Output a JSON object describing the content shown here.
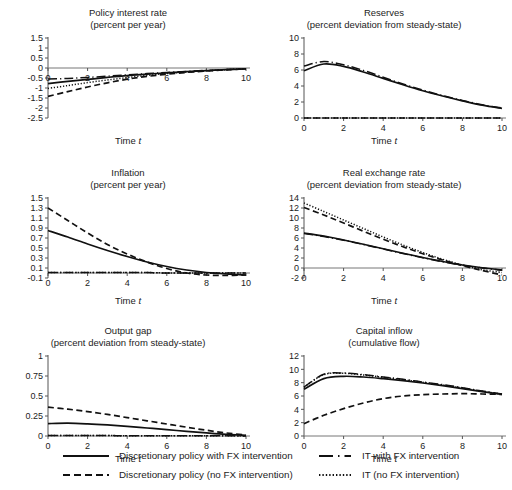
{
  "figure": {
    "xlabel": "Time (t)",
    "xlabel_symbol": "t",
    "legend": [
      {
        "label": "Discretionary policy with FX intervention",
        "style": "solid"
      },
      {
        "label": "Discretionary policy (no FX intervention)",
        "style": "dashed"
      },
      {
        "label": "IT with FX intervention",
        "style": "dash-dot"
      },
      {
        "label": "IT (no FX intervention)",
        "style": "dotted"
      }
    ]
  },
  "chart_data": [
    {
      "type": "line",
      "title": "Policy interest rate",
      "subtitle": "(percent per year)",
      "xlabel": "Time (t)",
      "ylabel": "",
      "xlim": [
        0,
        10
      ],
      "ylim": [
        -2.5,
        1.5
      ],
      "xticks": [
        0,
        2,
        4,
        6,
        8,
        10
      ],
      "yticks": [
        1.5,
        1,
        0.5,
        0,
        -0.5,
        -1,
        -1.5,
        -2,
        -2.5
      ],
      "ytick_labels": [
        "1.5",
        "1",
        "0.5",
        "0",
        "-0.5",
        "-1",
        "-1.5",
        "-2",
        "-2.5"
      ],
      "grid": false,
      "x": [
        0,
        1,
        2,
        3,
        4,
        5,
        6,
        7,
        8,
        9,
        10
      ],
      "series": [
        {
          "name": "Discretionary policy with FX intervention",
          "style": "solid",
          "values": [
            -0.78,
            -0.67,
            -0.57,
            -0.47,
            -0.38,
            -0.31,
            -0.24,
            -0.18,
            -0.13,
            -0.08,
            -0.04
          ]
        },
        {
          "name": "Discretionary policy (no FX intervention)",
          "style": "dashed",
          "values": [
            -1.42,
            -1.18,
            -0.95,
            -0.74,
            -0.56,
            -0.42,
            -0.31,
            -0.22,
            -0.15,
            -0.09,
            -0.04
          ]
        },
        {
          "name": "IT with FX intervention",
          "style": "dash-dot",
          "values": [
            -0.55,
            -0.52,
            -0.47,
            -0.41,
            -0.34,
            -0.28,
            -0.22,
            -0.17,
            -0.12,
            -0.08,
            -0.04
          ]
        },
        {
          "name": "IT (no FX intervention)",
          "style": "dotted",
          "values": [
            -1.02,
            -0.88,
            -0.73,
            -0.6,
            -0.48,
            -0.37,
            -0.28,
            -0.2,
            -0.14,
            -0.08,
            -0.04
          ]
        }
      ]
    },
    {
      "type": "line",
      "title": "Reserves",
      "subtitle": "(percent deviation from steady-state)",
      "xlabel": "Time (t)",
      "ylabel": "",
      "xlim": [
        0,
        10
      ],
      "ylim": [
        0,
        10
      ],
      "xticks": [
        0,
        2,
        4,
        6,
        8,
        10
      ],
      "yticks": [
        0,
        2,
        4,
        6,
        8,
        10
      ],
      "ytick_labels": [
        "0",
        "2",
        "4",
        "6",
        "8",
        "10"
      ],
      "grid": false,
      "x": [
        0,
        1,
        2,
        3,
        4,
        5,
        6,
        7,
        8,
        9,
        10
      ],
      "series": [
        {
          "name": "Discretionary policy with FX intervention",
          "style": "solid",
          "values": [
            5.9,
            6.75,
            6.45,
            5.75,
            4.95,
            4.15,
            3.4,
            2.75,
            2.15,
            1.6,
            1.2
          ]
        },
        {
          "name": "Discretionary policy (no FX intervention)",
          "style": "dashed",
          "values": [
            0,
            0,
            0,
            0,
            0,
            0,
            0,
            0,
            0,
            0,
            0
          ]
        },
        {
          "name": "IT with FX intervention",
          "style": "dash-dot",
          "values": [
            6.5,
            7.05,
            6.65,
            5.95,
            5.1,
            4.25,
            3.5,
            2.8,
            2.2,
            1.65,
            1.25
          ]
        },
        {
          "name": "IT (no FX intervention)",
          "style": "dotted",
          "values": [
            0,
            0,
            0,
            0,
            0,
            0,
            0,
            0,
            0,
            0,
            0
          ]
        }
      ]
    },
    {
      "type": "line",
      "title": "Inflation",
      "subtitle": "(percent per year)",
      "xlabel": "Time (t)",
      "ylabel": "",
      "xlim": [
        0,
        10
      ],
      "ylim": [
        -0.1,
        1.5
      ],
      "xticks": [
        0,
        2,
        4,
        6,
        8,
        10
      ],
      "yticks": [
        1.5,
        1.3,
        1.1,
        0.9,
        0.7,
        0.5,
        0.3,
        0.1,
        -0.1
      ],
      "ytick_labels": [
        "1.5",
        "1.3",
        "1.1",
        "0.9",
        "0.7",
        "0.5",
        "0.3",
        "0.1",
        "-0.1"
      ],
      "grid": false,
      "x": [
        0,
        1,
        2,
        3,
        4,
        5,
        6,
        7,
        8,
        9,
        10
      ],
      "series": [
        {
          "name": "Discretionary policy with FX intervention",
          "style": "solid",
          "values": [
            0.85,
            0.72,
            0.58,
            0.45,
            0.33,
            0.22,
            0.13,
            0.06,
            0.01,
            -0.02,
            -0.04
          ]
        },
        {
          "name": "Discretionary policy (no FX intervention)",
          "style": "dashed",
          "values": [
            1.3,
            1.05,
            0.8,
            0.57,
            0.38,
            0.22,
            0.09,
            0.0,
            -0.04,
            -0.05,
            -0.04
          ]
        },
        {
          "name": "IT with FX intervention",
          "style": "dash-dot",
          "values": [
            0.01,
            0.01,
            0.01,
            0.01,
            0.01,
            0.01,
            0.0,
            0.0,
            0.0,
            0.0,
            0.0
          ]
        },
        {
          "name": "IT (no FX intervention)",
          "style": "dotted",
          "values": [
            0.01,
            0.01,
            0.01,
            0.01,
            0.01,
            0.01,
            0.0,
            0.0,
            0.0,
            0.0,
            0.0
          ]
        }
      ]
    },
    {
      "type": "line",
      "title": "Real exchange rate",
      "subtitle": "(percent deviation from steady-state)",
      "xlabel": "Time (t)",
      "ylabel": "",
      "xlim": [
        0,
        10
      ],
      "ylim": [
        -2,
        14
      ],
      "xticks": [
        0,
        2,
        4,
        6,
        8,
        10
      ],
      "yticks": [
        14,
        12,
        10,
        8,
        6,
        4,
        2,
        0,
        -2
      ],
      "ytick_labels": [
        "14",
        "12",
        "10",
        "8",
        "6",
        "4",
        "2",
        "0",
        "-2"
      ],
      "grid": false,
      "x": [
        0,
        1,
        2,
        3,
        4,
        5,
        6,
        7,
        8,
        9,
        10
      ],
      "series": [
        {
          "name": "Discretionary policy with FX intervention",
          "style": "solid",
          "values": [
            7.0,
            6.4,
            5.6,
            4.75,
            3.85,
            2.95,
            2.1,
            1.3,
            0.6,
            0.05,
            -0.4
          ]
        },
        {
          "name": "Discretionary policy (no FX intervention)",
          "style": "dashed",
          "values": [
            12.1,
            10.6,
            9.0,
            7.35,
            5.75,
            4.25,
            2.85,
            1.6,
            0.5,
            -0.5,
            -1.4
          ]
        },
        {
          "name": "IT with FX intervention",
          "style": "dash-dot",
          "values": [
            6.9,
            6.3,
            5.55,
            4.7,
            3.8,
            2.9,
            2.05,
            1.25,
            0.55,
            0.0,
            -0.45
          ]
        },
        {
          "name": "IT (no FX intervention)",
          "style": "dotted",
          "values": [
            13.0,
            11.3,
            9.6,
            7.9,
            6.2,
            4.6,
            3.1,
            1.75,
            0.6,
            -0.35,
            -0.9
          ]
        }
      ]
    },
    {
      "type": "line",
      "title": "Output gap",
      "subtitle": "(percent deviation from steady-state)",
      "xlabel": "Time (t)",
      "ylabel": "",
      "xlim": [
        0,
        10
      ],
      "ylim": [
        0,
        1
      ],
      "xticks": [
        0,
        2,
        4,
        6,
        8,
        10
      ],
      "yticks": [
        1,
        0.75,
        0.5,
        0.25,
        0
      ],
      "ytick_labels": [
        "1",
        "0.75",
        "0.5",
        "0.25",
        "0"
      ],
      "grid": false,
      "x": [
        0,
        1,
        2,
        3,
        4,
        5,
        6,
        7,
        8,
        9,
        10
      ],
      "series": [
        {
          "name": "Discretionary policy with FX intervention",
          "style": "solid",
          "values": [
            0.155,
            0.16,
            0.152,
            0.138,
            0.12,
            0.1,
            0.08,
            0.058,
            0.038,
            0.02,
            0.008
          ]
        },
        {
          "name": "Discretionary policy (no FX intervention)",
          "style": "dashed",
          "values": [
            0.36,
            0.335,
            0.305,
            0.27,
            0.23,
            0.19,
            0.15,
            0.11,
            0.072,
            0.038,
            0.012
          ]
        },
        {
          "name": "IT with FX intervention",
          "style": "dash-dot",
          "values": [
            0.005,
            0.005,
            0.005,
            0.005,
            0.004,
            0.004,
            0.003,
            0.003,
            0.002,
            0.002,
            0.001
          ]
        },
        {
          "name": "IT (no FX intervention)",
          "style": "dotted",
          "values": [
            0.005,
            0.005,
            0.005,
            0.005,
            0.004,
            0.004,
            0.003,
            0.003,
            0.002,
            0.002,
            0.001
          ]
        }
      ]
    },
    {
      "type": "line",
      "title": "Capital inflow",
      "subtitle": "(cumulative flow)",
      "xlabel": "Time (t)",
      "ylabel": "",
      "xlim": [
        0,
        10
      ],
      "ylim": [
        0,
        12
      ],
      "xticks": [
        0,
        2,
        4,
        6,
        8,
        10
      ],
      "yticks": [
        12,
        10,
        8,
        6,
        4,
        2,
        0
      ],
      "ytick_labels": [
        "12",
        "10",
        "8",
        "6",
        "4",
        "2",
        "0"
      ],
      "grid": false,
      "x": [
        0,
        1,
        2,
        3,
        4,
        5,
        6,
        7,
        8,
        9,
        10
      ],
      "series": [
        {
          "name": "Discretionary policy with FX intervention",
          "style": "solid",
          "values": [
            7.0,
            8.6,
            8.95,
            8.85,
            8.6,
            8.3,
            7.95,
            7.55,
            7.1,
            6.65,
            6.25
          ]
        },
        {
          "name": "Discretionary policy (no FX intervention)",
          "style": "dashed",
          "values": [
            1.85,
            3.1,
            4.1,
            4.95,
            5.6,
            6.0,
            6.2,
            6.3,
            6.35,
            6.3,
            6.25
          ]
        },
        {
          "name": "IT with FX intervention",
          "style": "dash-dot",
          "values": [
            7.35,
            9.25,
            9.45,
            9.2,
            8.85,
            8.5,
            8.1,
            7.7,
            7.25,
            6.75,
            6.3
          ]
        },
        {
          "name": "IT (no FX intervention)",
          "style": "dotted",
          "values": [
            7.3,
            9.2,
            9.4,
            9.15,
            8.8,
            8.45,
            8.05,
            7.65,
            7.2,
            6.7,
            6.28
          ]
        }
      ]
    }
  ]
}
